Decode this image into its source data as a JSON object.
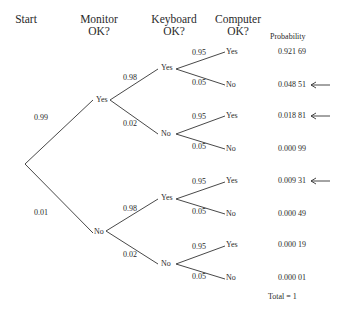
{
  "headers": {
    "start": "Start",
    "monitor": [
      "Monitor",
      "OK?"
    ],
    "keyboard": [
      "Keyboard",
      "OK?"
    ],
    "computer": [
      "Computer",
      "OK?"
    ],
    "probability": "Probability"
  },
  "tree": {
    "monitor": {
      "yes": {
        "label": "Yes",
        "prob": "0.99"
      },
      "no": {
        "label": "No",
        "prob": "0.01"
      }
    },
    "keyboard": [
      {
        "parent": "Monitor Yes",
        "yes": {
          "label": "Yes",
          "prob": "0.98"
        },
        "no": {
          "label": "No",
          "prob": "0.02"
        }
      },
      {
        "parent": "Monitor No",
        "yes": {
          "label": "Yes",
          "prob": "0.98"
        },
        "no": {
          "label": "No",
          "prob": "0.02"
        }
      }
    ],
    "computer": [
      {
        "yes": {
          "label": "Yes",
          "prob": "0.95"
        },
        "no": {
          "label": "No",
          "prob": "0.05"
        }
      },
      {
        "yes": {
          "label": "Yes",
          "prob": "0.95"
        },
        "no": {
          "label": "No",
          "prob": "0.05"
        }
      },
      {
        "yes": {
          "label": "Yes",
          "prob": "0.95"
        },
        "no": {
          "label": "No",
          "prob": "0.05"
        }
      },
      {
        "yes": {
          "label": "Yes",
          "prob": "0.95"
        },
        "no": {
          "label": "No",
          "prob": "0.05"
        }
      }
    ]
  },
  "outcomes": [
    {
      "path": "Yes-Yes-Yes",
      "probability": "0.921 69",
      "highlighted": false
    },
    {
      "path": "Yes-Yes-No",
      "probability": "0.048 51",
      "highlighted": true
    },
    {
      "path": "Yes-No-Yes",
      "probability": "0.018 81",
      "highlighted": true
    },
    {
      "path": "Yes-No-No",
      "probability": "0.000 99",
      "highlighted": false
    },
    {
      "path": "No-Yes-Yes",
      "probability": "0.009 31",
      "highlighted": true
    },
    {
      "path": "No-Yes-No",
      "probability": "0.000 49",
      "highlighted": false
    },
    {
      "path": "No-No-Yes",
      "probability": "0.000 19",
      "highlighted": false
    },
    {
      "path": "No-No-No",
      "probability": "0.000 01",
      "highlighted": false
    }
  ],
  "total": "Total = 1",
  "icons": {
    "highlight_marker": "left-arrow-icon"
  }
}
